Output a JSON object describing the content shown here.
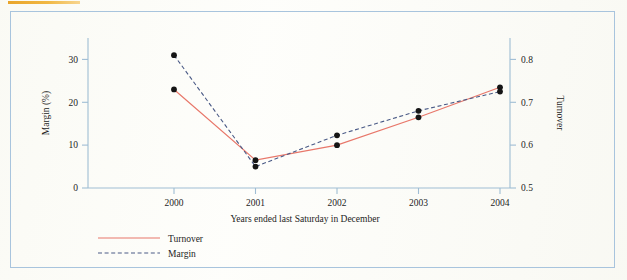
{
  "figure": {
    "border_color": "#a8c4dd",
    "top_rule_color": "#e8a020",
    "background_color": "#fcfcf8"
  },
  "chart_data": {
    "type": "line",
    "title": "",
    "subtitle": "",
    "xlabel": "Years ended last Saturday in December",
    "categories": [
      "2000",
      "2001",
      "2002",
      "2003",
      "2004"
    ],
    "x_tick_labels": [
      "2000",
      "2001",
      "2002",
      "2003",
      "2004"
    ],
    "grid": false,
    "legend_position": "below-left",
    "axes": {
      "left": {
        "label": "Margin (%)",
        "ticks": [
          0,
          10,
          20,
          30
        ],
        "tick_labels": [
          "0",
          "10",
          "20",
          "30"
        ],
        "lim": [
          0,
          35
        ],
        "color": "#9fbdd4"
      },
      "right": {
        "label": "Turnover",
        "ticks": [
          0.5,
          0.6,
          0.7,
          0.8
        ],
        "tick_labels": [
          "0.5",
          "0.6",
          "0.7",
          "0.8"
        ],
        "lim": [
          0.5,
          0.85
        ],
        "color": "#9fbdd4"
      }
    },
    "series": [
      {
        "name": "Turnover",
        "axis": "right",
        "style": "solid",
        "color": "#e8776a",
        "marker": "filled-circle",
        "marker_color": "#151515",
        "values": [
          0.73,
          0.565,
          0.6,
          0.665,
          0.735
        ]
      },
      {
        "name": "Margin",
        "axis": "left",
        "style": "dashed",
        "color": "#4a5a86",
        "marker": "filled-circle",
        "marker_color": "#151515",
        "values": [
          31.0,
          5.0,
          12.3,
          18.0,
          22.5
        ]
      }
    ],
    "legend": [
      {
        "label": "Turnover",
        "style": "solid",
        "color": "#e8776a"
      },
      {
        "label": "Margin",
        "style": "dashed",
        "color": "#4a5a86"
      }
    ]
  }
}
